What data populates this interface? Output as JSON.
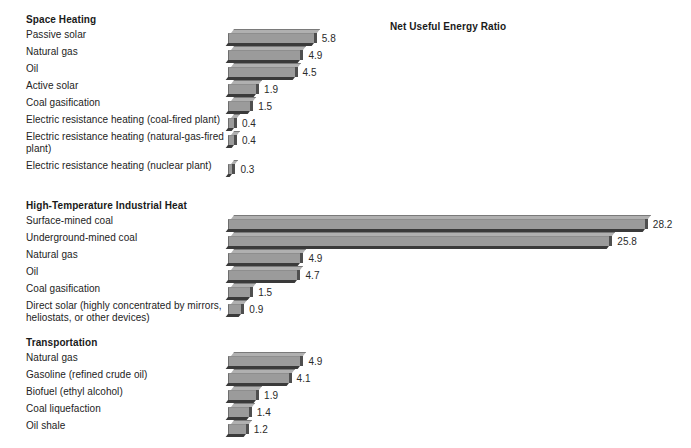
{
  "chart_data": {
    "type": "bar",
    "title": "Net Useful Energy Ratio",
    "xlabel": "",
    "ylabel": "",
    "orientation": "horizontal",
    "grid": false,
    "legend": "none",
    "xlim": [
      0,
      28.2
    ],
    "groups": [
      {
        "name": "Space Heating",
        "categories": [
          "Passive solar",
          "Natural gas",
          "Oil",
          "Active solar",
          "Coal gasification",
          "Electric resistance heating (coal-fired plant)",
          "Electric resistance heating (natural-gas-fired plant)",
          "Electric resistance heating (nuclear plant)"
        ],
        "values": [
          5.8,
          4.9,
          4.5,
          1.9,
          1.5,
          0.4,
          0.4,
          0.3
        ],
        "value_labels": [
          "5.8",
          "4.9",
          "4.5",
          "1.9",
          "1.5",
          "0.4",
          "0.4",
          "0.3"
        ]
      },
      {
        "name": "High-Temperature Industrial Heat",
        "categories": [
          "Surface-mined coal",
          "Underground-mined coal",
          "Natural gas",
          "Oil",
          "Coal gasification",
          "Direct solar (highly concentrated by mirrors, heliostats, or other devices)"
        ],
        "values": [
          28.2,
          25.8,
          4.9,
          4.7,
          1.5,
          0.9
        ],
        "value_labels": [
          "28.2",
          "25.8",
          "4.9",
          "4.7",
          "1.5",
          "0.9"
        ]
      },
      {
        "name": "Transportation",
        "categories": [
          "Natural gas",
          "Gasoline (refined crude oil)",
          "Biofuel (ethyl alcohol)",
          "Coal liquefaction",
          "Oil shale"
        ],
        "values": [
          4.9,
          4.1,
          1.9,
          1.4,
          1.2
        ],
        "value_labels": [
          "4.9",
          "4.1",
          "1.9",
          "1.4",
          "1.2"
        ]
      }
    ],
    "colors": {
      "bar_front": "#9b9b9b",
      "bar_top": "#b0b0b0",
      "bar_side": "#4f4f4f",
      "bar_shadow": "#3a3a3a",
      "text": "#1a1a1a",
      "background": "#ffffff"
    }
  }
}
